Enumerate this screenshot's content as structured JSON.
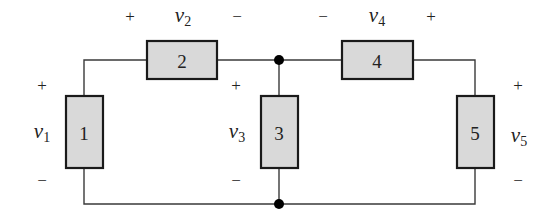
{
  "diagram": {
    "type": "circuit",
    "colors": {
      "wire": "#3a3a3a",
      "element_fill": "#d9d9d9",
      "element_border": "#1a1a1a",
      "node": "#000000"
    },
    "elements": [
      {
        "id": "1",
        "label": "1",
        "orientation": "vertical"
      },
      {
        "id": "2",
        "label": "2",
        "orientation": "horizontal"
      },
      {
        "id": "3",
        "label": "3",
        "orientation": "vertical"
      },
      {
        "id": "4",
        "label": "4",
        "orientation": "horizontal"
      },
      {
        "id": "5",
        "label": "5",
        "orientation": "vertical"
      }
    ],
    "voltages": [
      {
        "name": "v",
        "sub": "1",
        "plus": "+",
        "minus": "−"
      },
      {
        "name": "v",
        "sub": "2",
        "plus": "+",
        "minus": "−"
      },
      {
        "name": "v",
        "sub": "3",
        "plus": "+",
        "minus": "−"
      },
      {
        "name": "v",
        "sub": "4",
        "plus": "+",
        "minus": "−"
      },
      {
        "name": "v",
        "sub": "5",
        "plus": "+",
        "minus": "−"
      }
    ],
    "nodes": [
      "top-center-node",
      "bottom-center-node"
    ]
  }
}
